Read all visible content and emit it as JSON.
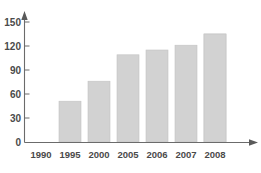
{
  "chart_data": {
    "type": "bar",
    "title": "",
    "subtitle": "",
    "xlabel": "",
    "ylabel": "",
    "categories": [
      "1990",
      "1995",
      "2000",
      "2005",
      "2006",
      "2007",
      "2008"
    ],
    "values": [
      35,
      51,
      76,
      109,
      115,
      121,
      135
    ],
    "series": [
      {
        "name": "",
        "values": [
          35,
          51,
          76,
          109,
          115,
          121,
          135
        ]
      }
    ],
    "ylim": [
      0,
      150
    ],
    "yticks": [
      0,
      30,
      60,
      90,
      120,
      150
    ],
    "ytick_labels": [
      "0",
      "30",
      "60",
      "90",
      "120",
      "150"
    ],
    "xtick_labels": [
      "1990",
      "1995",
      "2000",
      "2005",
      "2006",
      "2007",
      "2008"
    ],
    "grid": false,
    "legend": false,
    "legend_position": "none",
    "bar_color": "#d2d2d2",
    "bar_border_color": "#c4c4c4",
    "axis_color": "#6b6b6b",
    "label_color": "#4a4a4a",
    "background_color": "#ffffff",
    "axis_arrows": true,
    "annotations": []
  }
}
